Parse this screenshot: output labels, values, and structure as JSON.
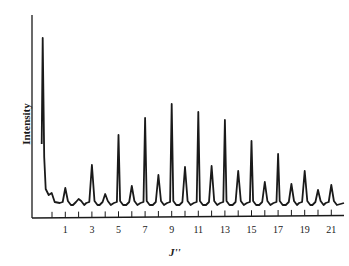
{
  "chart_data": {
    "type": "line",
    "title": "",
    "xlabel": "J''",
    "ylabel": "Intensity",
    "x_tick_labels": [
      "1",
      "3",
      "5",
      "7",
      "9",
      "11",
      "13",
      "15",
      "17",
      "19",
      "21"
    ],
    "x_ticks_minor": [
      0,
      1,
      2,
      3,
      4,
      5,
      6,
      7,
      8,
      9,
      10,
      11,
      12,
      13,
      14,
      15,
      16,
      17,
      18,
      19,
      20,
      21
    ],
    "xlim": [
      -1.5,
      22
    ],
    "ylim": [
      0,
      200
    ],
    "grid": false,
    "legend": null,
    "baseline_intensity": 13,
    "series": [
      {
        "name": "spectrum",
        "color": "#1a1a1a",
        "peaks": [
          {
            "J": -0.7,
            "intensity": 179
          },
          {
            "J": 1,
            "intensity": 29
          },
          {
            "J": 2,
            "intensity": 18
          },
          {
            "J": 3,
            "intensity": 52
          },
          {
            "J": 4,
            "intensity": 23
          },
          {
            "J": 5,
            "intensity": 82
          },
          {
            "J": 6,
            "intensity": 31
          },
          {
            "J": 7,
            "intensity": 99
          },
          {
            "J": 8,
            "intensity": 42
          },
          {
            "J": 9,
            "intensity": 113
          },
          {
            "J": 10,
            "intensity": 50
          },
          {
            "J": 11,
            "intensity": 105
          },
          {
            "J": 12,
            "intensity": 51
          },
          {
            "J": 13,
            "intensity": 97
          },
          {
            "J": 14,
            "intensity": 46
          },
          {
            "J": 15,
            "intensity": 76
          },
          {
            "J": 16,
            "intensity": 35
          },
          {
            "J": 17,
            "intensity": 63
          },
          {
            "J": 18,
            "intensity": 33
          },
          {
            "J": 19,
            "intensity": 46
          },
          {
            "J": 20,
            "intensity": 27
          },
          {
            "J": 21,
            "intensity": 32
          }
        ]
      }
    ]
  },
  "labels": {
    "ylabel": "Intensity",
    "xlabel": "J''"
  }
}
